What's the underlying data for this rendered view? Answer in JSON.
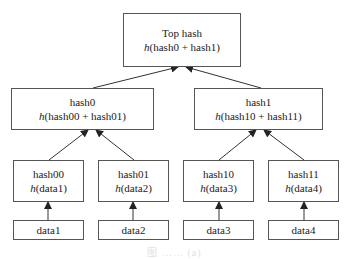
{
  "diagram": {
    "type": "merkle-tree",
    "nodes": {
      "top": {
        "title": "Top hash",
        "func": "h",
        "args": "(hash0 + hash1)"
      },
      "hash0": {
        "title": "hash0",
        "func": "h",
        "args": "(hash00 + hash01)"
      },
      "hash1": {
        "title": "hash1",
        "func": "h",
        "args": "(hash10 + hash11)"
      },
      "hash00": {
        "title": "hash00",
        "func": "h",
        "args": "(data1)"
      },
      "hash01": {
        "title": "hash01",
        "func": "h",
        "args": "(data2)"
      },
      "hash10": {
        "title": "hash10",
        "func": "h",
        "args": "(data3)"
      },
      "hash11": {
        "title": "hash11",
        "func": "h",
        "args": "(data4)"
      },
      "data1": {
        "title": "data1"
      },
      "data2": {
        "title": "data2"
      },
      "data3": {
        "title": "data3"
      },
      "data4": {
        "title": "data4"
      }
    },
    "edges": [
      [
        "hash0",
        "top"
      ],
      [
        "hash1",
        "top"
      ],
      [
        "hash00",
        "hash0"
      ],
      [
        "hash01",
        "hash0"
      ],
      [
        "hash10",
        "hash1"
      ],
      [
        "hash11",
        "hash1"
      ],
      [
        "data1",
        "hash00"
      ],
      [
        "data2",
        "hash01"
      ],
      [
        "data3",
        "hash10"
      ],
      [
        "data4",
        "hash11"
      ]
    ],
    "caption": "图 …… (a)"
  }
}
